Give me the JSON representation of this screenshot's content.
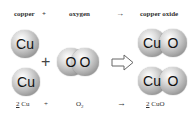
{
  "labels": {
    "reactant1": "copper",
    "plus": "+",
    "reactant2": "oxygen",
    "arrow": "→",
    "product": "copper oxide"
  },
  "atoms": {
    "cu": "Cu",
    "o": "O"
  },
  "equation": {
    "coef1": "2",
    "reactant1": " Cu",
    "plus": "+",
    "reactant2": "O",
    "reactant2_sub": "2",
    "arrow": "→",
    "coef2": "2",
    "product": " CuO"
  },
  "diagram": {
    "plus_sign": "+",
    "yields_arrow": "hollow-right-arrow"
  }
}
